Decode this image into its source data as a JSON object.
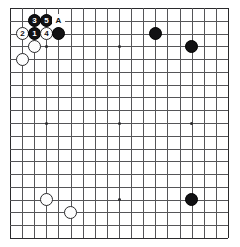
{
  "board": {
    "name": "go-board",
    "size": 19,
    "columns": 19,
    "rows": 19,
    "line_color": "#555558",
    "edge_color": "#2a2a2c",
    "background_color": "#ffffff",
    "black_stone_color": "#111113",
    "white_stone_color": "#fdfdfd",
    "star_points": [
      {
        "col": 4,
        "row": 4
      },
      {
        "col": 10,
        "row": 4
      },
      {
        "col": 16,
        "row": 4
      },
      {
        "col": 4,
        "row": 10
      },
      {
        "col": 10,
        "row": 10
      },
      {
        "col": 16,
        "row": 10
      },
      {
        "col": 4,
        "row": 16
      },
      {
        "col": 10,
        "row": 16
      },
      {
        "col": 16,
        "row": 16
      }
    ],
    "stones": [
      {
        "id": "move-3",
        "color": "black",
        "col": 3,
        "row": 2,
        "label": "3"
      },
      {
        "id": "move-5",
        "color": "black",
        "col": 4,
        "row": 2,
        "label": "5"
      },
      {
        "id": "move-2",
        "color": "white",
        "col": 2,
        "row": 3,
        "label": "2"
      },
      {
        "id": "move-1",
        "color": "black",
        "col": 3,
        "row": 3,
        "label": "1"
      },
      {
        "id": "move-4",
        "color": "white",
        "col": 4,
        "row": 3,
        "label": "4"
      },
      {
        "id": "black-corner-outer",
        "color": "black",
        "col": 5,
        "row": 3,
        "label": ""
      },
      {
        "id": "white-corner-lower",
        "color": "white",
        "col": 3,
        "row": 4,
        "label": ""
      },
      {
        "id": "white-left-side",
        "color": "white",
        "col": 2,
        "row": 5,
        "label": ""
      },
      {
        "id": "black-upper-right-inner",
        "color": "black",
        "col": 13,
        "row": 3,
        "label": ""
      },
      {
        "id": "black-upper-right-outer",
        "color": "black",
        "col": 16,
        "row": 4,
        "label": ""
      },
      {
        "id": "white-lower-left-upper",
        "color": "white",
        "col": 4,
        "row": 16,
        "label": ""
      },
      {
        "id": "white-lower-left-lower",
        "color": "white",
        "col": 6,
        "row": 17,
        "label": ""
      },
      {
        "id": "black-lower-right",
        "color": "black",
        "col": 16,
        "row": 16,
        "label": ""
      }
    ],
    "markers": [
      {
        "id": "marker-a",
        "col": 5,
        "row": 2,
        "label": "A"
      }
    ]
  }
}
